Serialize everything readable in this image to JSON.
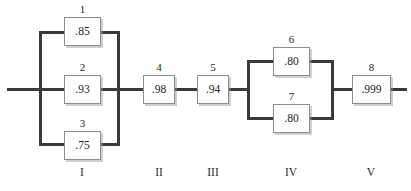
{
  "diagram": {
    "type": "reliability-block-diagram",
    "width": 411,
    "height": 191,
    "line_color": "#3a3a3a",
    "block_border_color": "#8c8c8c",
    "text_color": "#1d1d1d",
    "background_color": "#ffffff"
  },
  "blocks": [
    {
      "id": "1",
      "value": ".85",
      "stage": "I",
      "x": 64,
      "y": 17,
      "w": 37,
      "h": 29
    },
    {
      "id": "2",
      "value": ".93",
      "stage": "I",
      "x": 64,
      "y": 75,
      "w": 37,
      "h": 29
    },
    {
      "id": "3",
      "value": ".75",
      "stage": "I",
      "x": 64,
      "y": 131,
      "w": 37,
      "h": 29
    },
    {
      "id": "4",
      "value": ".98",
      "stage": "II",
      "x": 143,
      "y": 75,
      "w": 32,
      "h": 29
    },
    {
      "id": "5",
      "value": ".94",
      "stage": "III",
      "x": 197,
      "y": 75,
      "w": 32,
      "h": 29
    },
    {
      "id": "6",
      "value": ".80",
      "stage": "IV",
      "x": 273,
      "y": 47,
      "w": 37,
      "h": 29
    },
    {
      "id": "7",
      "value": ".80",
      "stage": "IV",
      "x": 273,
      "y": 104,
      "w": 37,
      "h": 29
    },
    {
      "id": "8",
      "value": ".999",
      "stage": "V",
      "x": 352,
      "y": 75,
      "w": 39,
      "h": 29
    }
  ],
  "stages": [
    {
      "label": "I",
      "center_x": 82,
      "y": 167
    },
    {
      "label": "II",
      "center_x": 159,
      "y": 167
    },
    {
      "label": "III",
      "center_x": 213,
      "y": 167
    },
    {
      "label": "IV",
      "center_x": 291,
      "y": 167
    },
    {
      "label": "V",
      "center_x": 371,
      "y": 167
    }
  ],
  "wires": [
    {
      "name": "input-lead",
      "orient": "h",
      "x": 7,
      "y": 88,
      "len": 34
    },
    {
      "name": "stage1-left-bus",
      "orient": "v",
      "x": 39,
      "y": 31,
      "len": 115
    },
    {
      "name": "stage1-branch1-left",
      "orient": "h",
      "x": 39,
      "y": 31,
      "len": 27
    },
    {
      "name": "stage1-branch2-left",
      "orient": "h",
      "x": 39,
      "y": 88,
      "len": 27
    },
    {
      "name": "stage1-branch3-left",
      "orient": "h",
      "x": 39,
      "y": 143,
      "len": 27
    },
    {
      "name": "stage1-branch1-right",
      "orient": "h",
      "x": 99,
      "y": 31,
      "len": 21
    },
    {
      "name": "stage1-branch2-right",
      "orient": "h",
      "x": 99,
      "y": 88,
      "len": 21
    },
    {
      "name": "stage1-branch3-right",
      "orient": "h",
      "x": 99,
      "y": 143,
      "len": 21
    },
    {
      "name": "stage1-right-bus",
      "orient": "v",
      "x": 117,
      "y": 31,
      "len": 115
    },
    {
      "name": "stage1-to-stage2",
      "orient": "h",
      "x": 117,
      "y": 88,
      "len": 28
    },
    {
      "name": "stage2-to-stage3",
      "orient": "h",
      "x": 173,
      "y": 88,
      "len": 26
    },
    {
      "name": "stage3-to-stage4",
      "orient": "h",
      "x": 227,
      "y": 88,
      "len": 23
    },
    {
      "name": "stage4-left-bus",
      "orient": "v",
      "x": 247,
      "y": 60,
      "len": 60
    },
    {
      "name": "stage4-branch1-left",
      "orient": "h",
      "x": 247,
      "y": 60,
      "len": 28
    },
    {
      "name": "stage4-branch2-left",
      "orient": "h",
      "x": 247,
      "y": 117,
      "len": 28
    },
    {
      "name": "stage4-branch1-right",
      "orient": "h",
      "x": 308,
      "y": 60,
      "len": 26
    },
    {
      "name": "stage4-branch2-right",
      "orient": "h",
      "x": 308,
      "y": 117,
      "len": 26
    },
    {
      "name": "stage4-right-bus",
      "orient": "v",
      "x": 331,
      "y": 60,
      "len": 60
    },
    {
      "name": "stage4-to-stage5",
      "orient": "h",
      "x": 331,
      "y": 88,
      "len": 23
    },
    {
      "name": "output-lead",
      "orient": "h",
      "x": 389,
      "y": 88,
      "len": 18
    }
  ]
}
